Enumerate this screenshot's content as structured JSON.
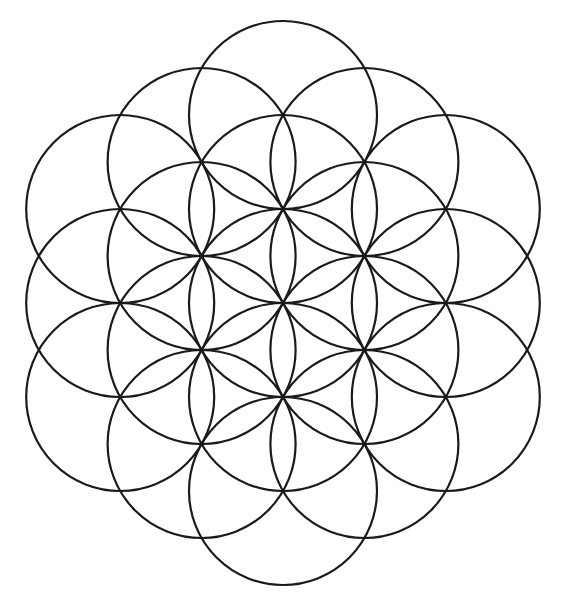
{
  "page": {
    "background_color": "#ffffff",
    "width": 563,
    "height": 603
  },
  "figure": {
    "name": "flower-of-life",
    "stroke_color": "#1a1a1a",
    "fill": "none",
    "stroke_width": 2.2,
    "circle_count": 19,
    "radius": 94,
    "lattice_spacing": 94,
    "center": {
      "x": 283,
      "y": 303
    },
    "bounds": {
      "left": 23,
      "top": 13,
      "right": 540,
      "bottom": 590
    },
    "rings": [
      {
        "name": "center",
        "distance": 0,
        "count": 1
      },
      {
        "name": "ring-1",
        "distance": 94,
        "count": 6
      },
      {
        "name": "ring-2",
        "distance": 163,
        "count": 6
      },
      {
        "name": "ring-3",
        "distance": 188,
        "count": 6
      }
    ],
    "circles": [
      {
        "id": "c-center",
        "cx": 283.0,
        "cy": 303.0,
        "r": 94,
        "ring": 0
      },
      {
        "id": "c-r1-n",
        "cx": 283.0,
        "cy": 209.0,
        "r": 94,
        "ring": 1
      },
      {
        "id": "c-r1-ne",
        "cx": 364.4,
        "cy": 256.0,
        "r": 94,
        "ring": 1
      },
      {
        "id": "c-r1-se",
        "cx": 364.4,
        "cy": 350.0,
        "r": 94,
        "ring": 1
      },
      {
        "id": "c-r1-s",
        "cx": 283.0,
        "cy": 397.0,
        "r": 94,
        "ring": 1
      },
      {
        "id": "c-r1-sw",
        "cx": 201.6,
        "cy": 350.0,
        "r": 94,
        "ring": 1
      },
      {
        "id": "c-r1-nw",
        "cx": 201.6,
        "cy": 256.0,
        "r": 94,
        "ring": 1
      },
      {
        "id": "c-r2-nw",
        "cx": 201.6,
        "cy": 162.0,
        "r": 94,
        "ring": 2
      },
      {
        "id": "c-r2-ne",
        "cx": 364.4,
        "cy": 162.0,
        "r": 94,
        "ring": 2
      },
      {
        "id": "c-r2-e",
        "cx": 445.8,
        "cy": 303.0,
        "r": 94,
        "ring": 2
      },
      {
        "id": "c-r2-se",
        "cx": 364.4,
        "cy": 444.0,
        "r": 94,
        "ring": 2
      },
      {
        "id": "c-r2-sw",
        "cx": 201.6,
        "cy": 444.0,
        "r": 94,
        "ring": 2
      },
      {
        "id": "c-r2-w",
        "cx": 120.2,
        "cy": 303.0,
        "r": 94,
        "ring": 2
      },
      {
        "id": "c-r3-n",
        "cx": 283.0,
        "cy": 115.0,
        "r": 94,
        "ring": 3
      },
      {
        "id": "c-r3-ne",
        "cx": 445.8,
        "cy": 209.0,
        "r": 94,
        "ring": 3
      },
      {
        "id": "c-r3-se",
        "cx": 445.8,
        "cy": 397.0,
        "r": 94,
        "ring": 3
      },
      {
        "id": "c-r3-s",
        "cx": 283.0,
        "cy": 491.0,
        "r": 94,
        "ring": 3
      },
      {
        "id": "c-r3-sw",
        "cx": 120.2,
        "cy": 397.0,
        "r": 94,
        "ring": 3
      },
      {
        "id": "c-r3-nw",
        "cx": 120.2,
        "cy": 209.0,
        "r": 94,
        "ring": 3
      }
    ]
  }
}
